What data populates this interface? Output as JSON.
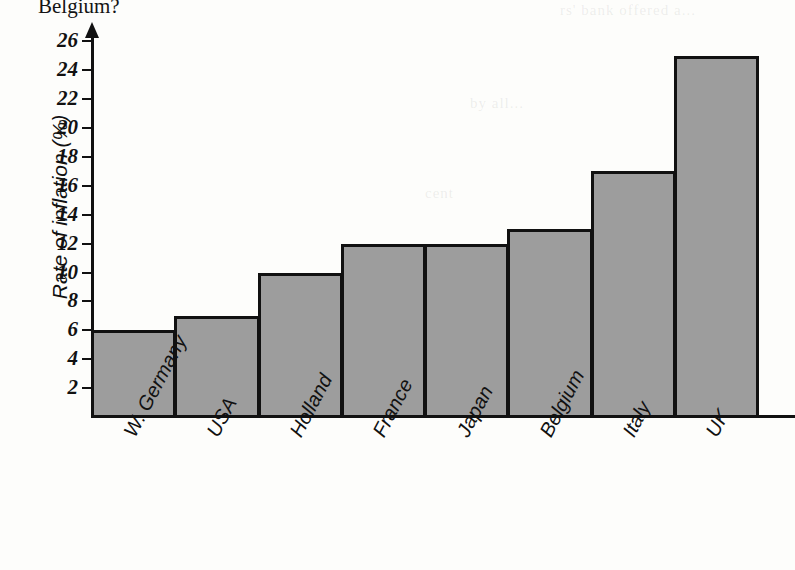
{
  "page": {
    "trailing_question_text": "Belgium?",
    "bleed_through": [
      {
        "text": "rs' bank offered a...",
        "x": 560,
        "y": 2
      },
      {
        "text": "by all...",
        "x": 470,
        "y": 95
      },
      {
        "text": "cent",
        "x": 425,
        "y": 185
      },
      {
        "text": "was",
        "x": 600,
        "y": 300
      }
    ]
  },
  "chart_data": {
    "type": "bar",
    "title": "",
    "subtitle": "",
    "xlabel": "",
    "ylabel": "Rate of inflation (%)",
    "categories": [
      "W. Germany",
      "USA",
      "Holland",
      "France",
      "Japan",
      "Belgium",
      "Italy",
      "UK"
    ],
    "values": [
      6,
      7,
      10,
      12,
      12,
      13,
      17,
      25
    ],
    "ylim": [
      0,
      27
    ],
    "y_ticks": [
      26,
      24,
      22,
      20,
      18,
      16,
      14,
      12,
      10,
      8,
      6,
      4,
      2
    ],
    "grid": false,
    "legend": null,
    "bar_fill_color": "#9d9d9d",
    "bar_edge_color": "#111111",
    "axis_color": "#111111",
    "bars_contiguous": true
  }
}
